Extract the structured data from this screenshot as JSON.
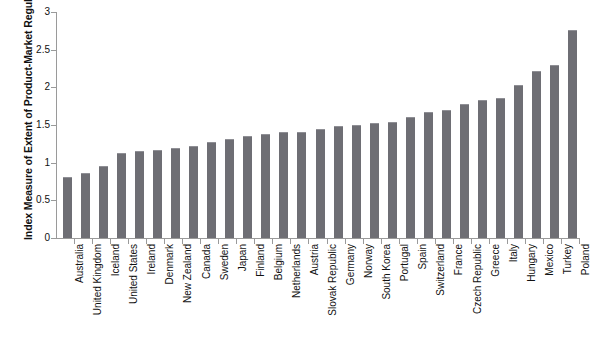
{
  "chart_data": {
    "type": "bar",
    "title": "",
    "xlabel": "",
    "ylabel": "Index Measure of Extent of Product-Market Regulations",
    "ylim": [
      0,
      3
    ],
    "ytick_values": [
      0,
      0.5,
      1,
      1.5,
      2,
      2.5,
      3
    ],
    "ytick_labels": [
      "0",
      "0.5",
      "1",
      "1.5",
      "2",
      "2.5",
      "3"
    ],
    "grid": false,
    "legend": null,
    "bar_color": "#6e6e74",
    "categories": [
      "Australia",
      "United Kingdom",
      "Iceland",
      "United States",
      "Ireland",
      "Denmark",
      "New Zealand",
      "Canada",
      "Sweden",
      "Japan",
      "Finland",
      "Belgium",
      "Netherlands",
      "Austria",
      "Slovak Republic",
      "Germany",
      "Norway",
      "South Korea",
      "Portugal",
      "Spain",
      "Switzerland",
      "France",
      "Czech Republic",
      "Greece",
      "Italy",
      "Hungary",
      "Mexico",
      "Turkey",
      "Poland"
    ],
    "values": [
      0.8,
      0.85,
      0.94,
      1.11,
      1.14,
      1.15,
      1.18,
      1.21,
      1.26,
      1.3,
      1.34,
      1.37,
      1.39,
      1.4,
      1.44,
      1.47,
      1.49,
      1.51,
      1.53,
      1.59,
      1.66,
      1.68,
      1.76,
      1.82,
      1.85,
      2.02,
      2.2,
      2.28,
      2.75
    ]
  }
}
